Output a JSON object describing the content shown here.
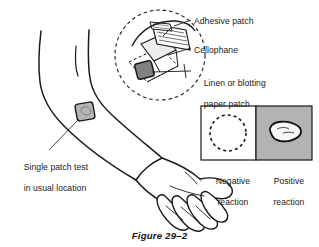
{
  "figure": {
    "caption": "Figure 29–2",
    "background_color": "#ffffff",
    "ink_color": "#1a1a1a"
  },
  "callouts": {
    "adhesive_patch": "Adhesive patch",
    "cellophane": "Cellophane",
    "linen_line1": "Linen or blotting",
    "linen_line2": "paper patch",
    "single_patch_line1": "Single patch test",
    "single_patch_line2": "in usual location"
  },
  "reaction_panels": {
    "negative": {
      "label_line1": "Negative",
      "label_line2": "reaction",
      "fill_color": "#ffffff",
      "border_color": "#1a1a1a",
      "marker": "dashed-circle"
    },
    "positive": {
      "label_line1": "Positive",
      "label_line2": "reaction",
      "fill_color": "#b3b3b3",
      "border_color": "#1a1a1a",
      "marker": "irregular-blotch"
    }
  },
  "illustration": {
    "arm": "forearm-with-hand",
    "arm_patch_color": "#b5b5b5",
    "inset": {
      "shape": "dashed-magnifier-circle",
      "patch_color": "#808080",
      "cellophane_color": "#e8e8e8"
    }
  }
}
